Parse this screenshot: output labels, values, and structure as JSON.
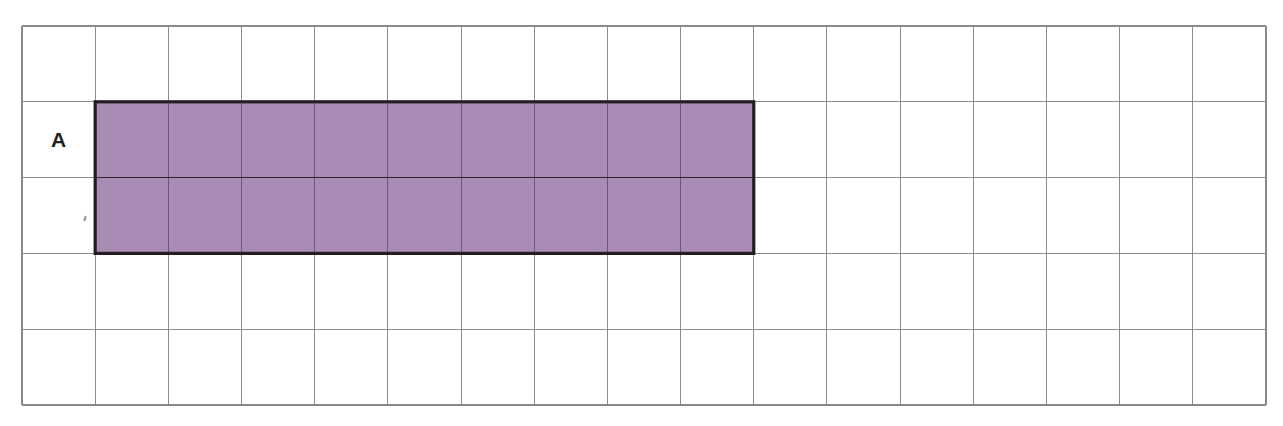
{
  "page": {
    "background_color": "#ffffff",
    "width": 1283,
    "height": 426
  },
  "grid": {
    "name": "unit-square-grid",
    "columns": 17,
    "rows": 5,
    "left": 22,
    "top": 26,
    "right": 1266,
    "bottom": 405,
    "cell_width": 73.2,
    "cell_height": 75.8,
    "line_color": "#8d8d8d",
    "outer_line_color": "#8a8a8a"
  },
  "shapes": [
    {
      "name": "rectangle-A",
      "label": "A",
      "fill_color": "#a98cb5",
      "outline_color": "#241c22",
      "start_column": 2,
      "start_row": 2,
      "columns_spanned": 9,
      "rows_spanned": 2,
      "unit_squares": 18,
      "x": 95,
      "y": 102,
      "width": 659,
      "height": 151
    }
  ],
  "labels": [
    {
      "name": "label-A",
      "text": "A",
      "column": 1,
      "row": 2,
      "color": "#231f20"
    }
  ]
}
